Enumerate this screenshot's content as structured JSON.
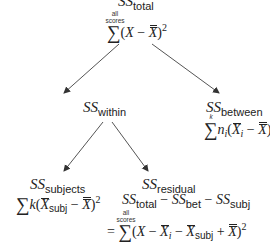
{
  "diagram": {
    "nodes": {
      "total": {
        "label": "SS",
        "subscript": "total",
        "sum_lower": "",
        "sum_upper_line1": "all",
        "sum_upper_line2": "scores",
        "formula": "∑(X − X̿)²"
      },
      "within": {
        "label": "SS",
        "subscript": "within"
      },
      "between": {
        "label": "SS",
        "subscript": "between",
        "sum_upper": "k",
        "formula": "∑nᵢ(X̄ᵢ − X̿)²"
      },
      "subjects": {
        "label": "SS",
        "subscript": "subjects",
        "formula": "∑k(X̄subj − X̿)²"
      },
      "residual": {
        "label": "SS",
        "subscript": "residual",
        "line1": "SStotal − SSbet − SSsubj",
        "sum_upper_line1": "all",
        "sum_upper_line2": "scores",
        "formula": "= ∑(X − X̄ᵢ − X̄subj + X̿)²"
      }
    },
    "text": {
      "ss": "SS",
      "sub_total": "total",
      "sub_within": "within",
      "sub_between": "between",
      "sub_subjects": "subjects",
      "sub_residual": "residual",
      "sub_bet": "bet",
      "sub_subj": "subj",
      "all": "all",
      "scores": "scores",
      "k": "k",
      "sigma": "∑",
      "X": "X",
      "n": "n",
      "i": "i",
      "minus": " − ",
      "plus": " + ",
      "equals": "=",
      "lparen": "(",
      "rparen": ")",
      "sq": "2"
    },
    "edges": [
      {
        "from": "total",
        "to": "within"
      },
      {
        "from": "total",
        "to": "between"
      },
      {
        "from": "within",
        "to": "subjects"
      },
      {
        "from": "within",
        "to": "residual"
      }
    ],
    "colors": {
      "text": "#222222",
      "arrow": "#444444",
      "background": "#ffffff"
    }
  }
}
